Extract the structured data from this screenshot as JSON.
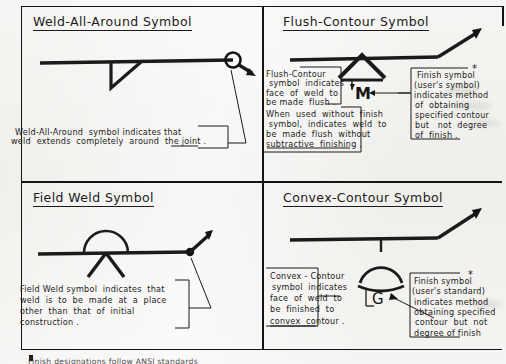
{
  "document": {
    "type": "welding-symbol-reference-plate",
    "background_color": "#f1f0ed",
    "ink_color": "#141414"
  },
  "quadrants": [
    {
      "id": "weld-all-around",
      "title": "Weld-All-Around Symbol",
      "caption_lines": [
        "Weld-All-Around  symbol indicates that",
        "weld  extends  completely  around  the joint ."
      ],
      "symbol_name": "weld-all-around-symbol"
    },
    {
      "id": "flush-contour",
      "title": "Flush-Contour Symbol",
      "caption_lines": [
        "Flush-Contour",
        "symbol  indicates",
        "face  of  weld  to",
        "be made  flush .",
        "When  used  without  finish",
        " symbol,  indicates  weld  to",
        "be  made  flush  without",
        "subtractive  finishing ."
      ],
      "finish_note_lines": [
        "Finish symbol",
        "(user's symbol)",
        "indicates method",
        "of  obtaining",
        "specified contour",
        "but   not  degree",
        "of  finish ."
      ],
      "finish_marker": "*",
      "weld_letter": "M",
      "symbol_name": "flush-contour-symbol"
    },
    {
      "id": "field-weld",
      "title": "Field Weld Symbol",
      "caption_lines": [
        "Field Weld symbol  indicates  that",
        "weld  is  to  be  made  at  a  place",
        "other  than  that  of  initial",
        "construction ."
      ],
      "symbol_name": "field-weld-symbol"
    },
    {
      "id": "convex-contour",
      "title": "Convex-Contour Symbol",
      "caption_lines": [
        "Convex - Contour",
        "symbol  indicates",
        "face  of  weld  to",
        "be  finished  to",
        "convex  contour ."
      ],
      "finish_note_lines": [
        "Finish symbol",
        "(user's standard)",
        "indicates method",
        "obtaining specified",
        "contour  but  not",
        "degree of finish"
      ],
      "finish_marker": "*",
      "weld_letter": "G",
      "symbol_name": "convex-contour-symbol"
    }
  ],
  "footnote": {
    "bullet": "*",
    "text": "Finish  designations  follow  ANSI  standards"
  }
}
